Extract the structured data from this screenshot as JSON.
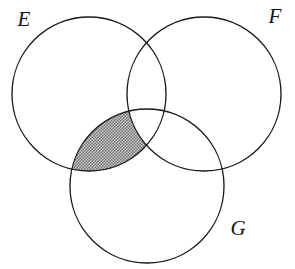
{
  "figure": {
    "kind": "venn-diagram",
    "set_count": 3,
    "background_color": "#ffffff",
    "stroke_color": "#1a1a1a",
    "stroke_width": 1.35,
    "shade_color": "#9d9d9d",
    "label_color": "#141414",
    "width": 295,
    "height": 269
  },
  "sets": [
    {
      "id": "E",
      "label": "E",
      "cx": 89,
      "cy": 94,
      "r": 77,
      "label_x": 24,
      "label_y": 21
    },
    {
      "id": "F",
      "label": "F",
      "cx": 204,
      "cy": 94,
      "r": 77,
      "label_x": 275,
      "label_y": 18
    },
    {
      "id": "G",
      "label": "G",
      "cx": 147,
      "cy": 186,
      "r": 77,
      "label_x": 238,
      "label_y": 230
    }
  ],
  "shaded_region": {
    "description": "E and G but not F",
    "expression": "(E ∩ G) \\ F",
    "fill": "#9d9d9d",
    "pattern": "stipple",
    "includes": [
      "E",
      "G"
    ],
    "excludes": [
      "F"
    ]
  }
}
